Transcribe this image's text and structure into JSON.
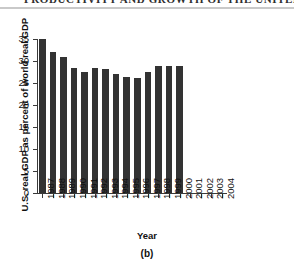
{
  "page_head": {
    "running_head": "PRODUCTIVITY AND GROWTH OF THE UNITED STATES"
  },
  "figure": {
    "caption": "(b)",
    "colors": {
      "bar": "#333333",
      "axis": "#3a3a3a",
      "text": "#111111",
      "background": "#ffffff"
    }
  },
  "chart_data": {
    "type": "bar",
    "title": "",
    "xlabel": "Year",
    "ylabel": "U.S. real GDP as percent of world real GDP",
    "categories": [
      "1987",
      "1988",
      "1989",
      "1990",
      "1991",
      "1992",
      "1993",
      "1994",
      "1995",
      "1996",
      "1997",
      "1998",
      "1999",
      "2000",
      "2001",
      "2002",
      "2003",
      "2004"
    ],
    "values": [
      35.0,
      32.0,
      31.0,
      28.5,
      27.5,
      28.5,
      28.3,
      27.0,
      26.3,
      26.2,
      27.5,
      28.8,
      28.8,
      28.8,
      null,
      null,
      null,
      null
    ],
    "ylim": [
      0,
      35
    ],
    "yticks": [
      0,
      5,
      10,
      15,
      20,
      25,
      30,
      35
    ],
    "ytick_labels": [
      "0",
      "5",
      "10",
      "15",
      "20",
      "25",
      "30",
      "35"
    ],
    "grid": false,
    "legend": false
  }
}
